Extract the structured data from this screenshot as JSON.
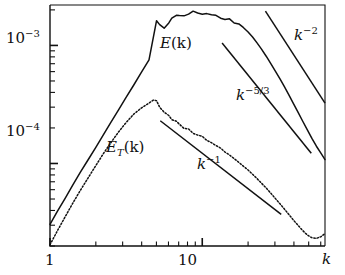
{
  "chart_data": {
    "type": "line",
    "title": "",
    "xlabel": "k",
    "ylabel": "",
    "xscale": "log",
    "yscale": "log",
    "xlim": [
      1,
      64
    ],
    "ylim": [
      2e-05,
      0.0022
    ],
    "grid": false,
    "legend": "inline-annotations",
    "x_ticks_major": [
      {
        "value": 1,
        "label": "1"
      },
      {
        "value": 10,
        "label": "10"
      }
    ],
    "x_ticks_minor": [
      2,
      3,
      4,
      5,
      6,
      7,
      8,
      9,
      20,
      30,
      40,
      50,
      60
    ],
    "y_ticks_major": [
      {
        "value": 0.001,
        "mantissa": "10",
        "exponent": "-3",
        "label": "10^-3"
      },
      {
        "value": 0.0001,
        "mantissa": "10",
        "exponent": "-4",
        "label": "10^-4"
      }
    ],
    "y_ticks_minor": [
      0.0009,
      0.0008,
      0.0007,
      0.0006,
      0.0005,
      0.0004,
      0.0003,
      0.0002,
      9e-05,
      8e-05,
      7e-05,
      6e-05,
      5e-05,
      4e-05,
      3e-05,
      2e-05,
      0.002
    ],
    "series": [
      {
        "name": "E(k)",
        "label": "E(k)",
        "style": "solid",
        "color": "#111111",
        "points": [
          [
            1.0,
            3.05e-05
          ],
          [
            1.12,
            3.95e-05
          ],
          [
            1.26,
            5.1e-05
          ],
          [
            1.41,
            6.55e-05
          ],
          [
            1.58,
            8.4e-05
          ],
          [
            1.78,
            0.0001075
          ],
          [
            2.0,
            0.000137
          ],
          [
            2.24,
            0.000175
          ],
          [
            2.51,
            0.000223
          ],
          [
            2.82,
            0.000285
          ],
          [
            3.16,
            0.000363
          ],
          [
            3.55,
            0.000462
          ],
          [
            3.98,
            0.00059
          ],
          [
            4.47,
            0.000755
          ],
          [
            5.01,
            0.00162
          ],
          [
            5.25,
            0.0015
          ],
          [
            5.62,
            0.0014
          ],
          [
            6.03,
            0.00155
          ],
          [
            6.31,
            0.0017
          ],
          [
            6.76,
            0.0018
          ],
          [
            7.08,
            0.00179
          ],
          [
            7.59,
            0.00178
          ],
          [
            8.13,
            0.00184
          ],
          [
            8.71,
            0.00195
          ],
          [
            9.33,
            0.00188
          ],
          [
            10.0,
            0.00184
          ],
          [
            10.7,
            0.00186
          ],
          [
            11.5,
            0.00182
          ],
          [
            12.3,
            0.0018
          ],
          [
            13.2,
            0.0017
          ],
          [
            14.1,
            0.00166
          ],
          [
            15.1,
            0.00168
          ],
          [
            16.2,
            0.00155
          ],
          [
            17.4,
            0.00152
          ],
          [
            18.6,
            0.00142
          ],
          [
            20.0,
            0.0013
          ],
          [
            21.4,
            0.00118
          ],
          [
            22.9,
            0.00105
          ],
          [
            24.5,
            0.00093
          ],
          [
            26.3,
            0.00081
          ],
          [
            28.2,
            0.0007
          ],
          [
            30.2,
            0.000605
          ],
          [
            32.4,
            0.00052
          ],
          [
            34.7,
            0.000445
          ],
          [
            37.2,
            0.000378
          ],
          [
            39.8,
            0.00032
          ],
          [
            42.7,
            0.00027
          ],
          [
            45.7,
            0.000228
          ],
          [
            49.0,
            0.000193
          ],
          [
            52.5,
            0.000163
          ],
          [
            56.2,
            0.00014
          ],
          [
            60.3,
            0.000122
          ],
          [
            64.0,
            0.000108
          ]
        ]
      },
      {
        "name": "E_T(k)",
        "label": "E_T(k)",
        "style": "dotted",
        "color": "#111111",
        "points": [
          [
            1.0,
            2.05e-05
          ],
          [
            1.12,
            2.7e-05
          ],
          [
            1.26,
            3.55e-05
          ],
          [
            1.41,
            4.6e-05
          ],
          [
            1.58,
            5.9e-05
          ],
          [
            1.78,
            7.55e-05
          ],
          [
            2.0,
            9.6e-05
          ],
          [
            2.24,
            0.000121
          ],
          [
            2.51,
            0.00015
          ],
          [
            2.82,
            0.000185
          ],
          [
            3.16,
            0.000222
          ],
          [
            3.55,
            0.000262
          ],
          [
            3.98,
            0.000295
          ],
          [
            4.47,
            0.000325
          ],
          [
            4.79,
            0.000345
          ],
          [
            5.01,
            0.00034
          ],
          [
            5.25,
            0.0003
          ],
          [
            5.62,
            0.000272
          ],
          [
            6.03,
            0.000255
          ],
          [
            6.31,
            0.000235
          ],
          [
            6.76,
            0.000228
          ],
          [
            7.08,
            0.000215
          ],
          [
            7.59,
            0.000198
          ],
          [
            8.13,
            0.000196
          ],
          [
            8.71,
            0.00018
          ],
          [
            9.33,
            0.000174
          ],
          [
            10.0,
            0.00017
          ],
          [
            10.7,
            0.000157
          ],
          [
            11.5,
            0.00015
          ],
          [
            12.3,
            0.000142
          ],
          [
            13.2,
            0.000135
          ],
          [
            14.1,
            0.000125
          ],
          [
            15.1,
            0.000118
          ],
          [
            16.2,
            0.00011
          ],
          [
            17.4,
            0.000102
          ],
          [
            18.6,
            9.5e-05
          ],
          [
            20.0,
            8.8e-05
          ],
          [
            21.4,
            8.1e-05
          ],
          [
            22.9,
            7.45e-05
          ],
          [
            24.5,
            6.8e-05
          ],
          [
            26.3,
            6.2e-05
          ],
          [
            28.2,
            5.6e-05
          ],
          [
            30.2,
            5.05e-05
          ],
          [
            32.4,
            4.55e-05
          ],
          [
            34.7,
            4.1e-05
          ],
          [
            37.2,
            3.68e-05
          ],
          [
            39.8,
            3.3e-05
          ],
          [
            42.7,
            2.98e-05
          ],
          [
            45.7,
            2.7e-05
          ],
          [
            49.0,
            2.48e-05
          ],
          [
            52.5,
            2.35e-05
          ],
          [
            56.2,
            2.32e-05
          ],
          [
            60.3,
            2.4e-05
          ],
          [
            64.0,
            2.55e-05
          ]
        ]
      }
    ],
    "reference_lines": [
      {
        "name": "k^-2",
        "label": "k^-2",
        "exponent": -2,
        "x_start": 26.0,
        "x_end": 64.0,
        "y_start": 0.00195,
        "y_end": 0.000325
      },
      {
        "name": "k^-5/3",
        "label": "k^-5/3",
        "exponent": -1.6667,
        "x_start": 13.5,
        "x_end": 52.0,
        "y_start": 0.00105,
        "y_end": 0.000122
      },
      {
        "name": "k^-1",
        "label": "k^-1",
        "exponent": -1,
        "x_start": 5.3,
        "x_end": 33.0,
        "y_start": 0.00023,
        "y_end": 3.7e-05
      }
    ],
    "annotations": [
      {
        "name": "E(k)",
        "mantissa": "E",
        "suffix": "(k)",
        "x_px": 160,
        "y_px": 38
      },
      {
        "name": "E_T(k)",
        "mantissa": "E",
        "sub": "T",
        "suffix": "(k)",
        "x_px": 106,
        "y_px": 142
      },
      {
        "name": "k^-2",
        "mantissa": "k",
        "sup": "−2",
        "x_px": 295,
        "y_px": 28
      },
      {
        "name": "k^-5/3",
        "mantissa": "k",
        "sup": "−5/3",
        "x_px": 238,
        "y_px": 88
      },
      {
        "name": "k^-1",
        "mantissa": "k",
        "sup": "−1",
        "x_px": 198,
        "y_px": 157
      }
    ]
  },
  "labels": {
    "y_major_1_mant": "10",
    "y_major_1_exp": "−3",
    "y_major_2_mant": "10",
    "y_major_2_exp": "−4",
    "x_major_1": "1",
    "x_major_2": "10",
    "x_axis_title": "k",
    "ek_mant": "E",
    "ek_suffix": "(k)",
    "et_mant": "E",
    "et_sub": "T",
    "et_suffix": "(k)",
    "k2_mant": "k",
    "k2_exp": "−2",
    "k53_mant": "k",
    "k53_exp": "−5/3",
    "k1_mant": "k",
    "k1_exp": "−1"
  },
  "style": {
    "axis_color": "#111111",
    "curve_color": "#111111",
    "background": "#ffffff"
  }
}
